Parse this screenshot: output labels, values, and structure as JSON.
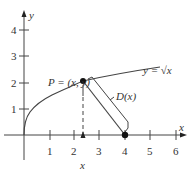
{
  "figure": {
    "axes": {
      "x_label": "x",
      "y_label": "y",
      "x_ticks": [
        "1",
        "2",
        "3",
        "4",
        "5",
        "6"
      ],
      "y_ticks": [
        "1",
        "2",
        "3",
        "4"
      ]
    },
    "curve_label": "y = √x",
    "point_label": "P = (x, y)",
    "distance_label": "D(x)",
    "x_marker_label": "x",
    "fixed_point": {
      "x": 4,
      "y": 0
    },
    "point_x": 2.3,
    "colors": {
      "line": "#333333",
      "background": "#ffffff"
    }
  }
}
